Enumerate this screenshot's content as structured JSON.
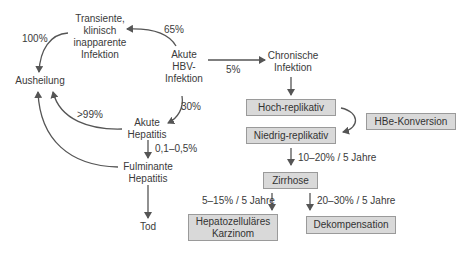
{
  "diagram": {
    "nodes": {
      "transient": "Transiente,\nklinisch\ninapparente\nInfektion",
      "ausheilung": "Ausheilung",
      "akute_hbv": "Akute\nHBV-\nInfektion",
      "akute_hepatitis": "Akute\nHepatitis",
      "fulminante": "Fulminante\nHepatitis",
      "tod": "Tod",
      "chronische": "Chronische\nInfektion",
      "hoch": "Hoch-replikativ",
      "niedrig": "Niedrig-replikativ",
      "hbe": "HBe-Konversion",
      "zirrhose": "Zirrhose",
      "hcc": "Hepatozelluläres\nKarzinom",
      "dekomp": "Dekompensation"
    },
    "edges": {
      "hbv_to_transient": "65%",
      "transient_to_ausheilung": "100%",
      "hbv_to_chronisch": "5%",
      "hbv_to_akute": "30%",
      "akute_to_ausheilung": ">99%",
      "akute_to_fulminant": "0,1–0,5%",
      "niedrig_to_zirrhose": "10–20% / 5 Jahre",
      "zirrhose_to_hcc": "5–15% / 5 Jahre",
      "zirrhose_to_dekomp": "20–30% / 5 Jahre"
    },
    "colors": {
      "box_fill": "#d9d9d9",
      "box_border": "#9a9a9a",
      "line": "#555555"
    }
  }
}
